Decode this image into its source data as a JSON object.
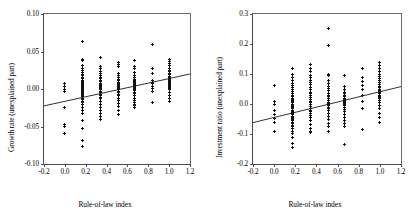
{
  "figure": {
    "panel_count": 2,
    "marker_style": "plus-marker",
    "line_color": "#1a1a1a",
    "axis_color": "#4a4a4a"
  },
  "chart_data": [
    {
      "type": "scatter",
      "panel": "left",
      "title": "",
      "xlabel": "Rule-of-law index",
      "ylabel": "Growth rate (unexplained part)",
      "xlim": [
        -0.2,
        1.2
      ],
      "ylim": [
        -0.1,
        0.1
      ],
      "xticks": [
        -0.2,
        0.0,
        0.2,
        0.4,
        0.6,
        0.8,
        1.0,
        1.2
      ],
      "xticklabels": [
        "-0.2",
        "0.0",
        "0.2",
        "0.4",
        "0.6",
        "0.8",
        "1.0",
        "1.2"
      ],
      "yticks": [
        -0.1,
        -0.05,
        0.0,
        0.05,
        0.1
      ],
      "yticklabels": [
        "-0.10",
        "-0.05",
        "0.00",
        "0.05",
        "0.10"
      ],
      "grid": false,
      "legend": "none",
      "fit_line": {
        "x": [
          -0.2,
          1.2
        ],
        "y": [
          -0.0225,
          0.02
        ]
      },
      "x": [
        0.0,
        0.0,
        0.0,
        0.0,
        0.0,
        0.0,
        0.0,
        0.0,
        0.17,
        0.17,
        0.17,
        0.17,
        0.17,
        0.17,
        0.17,
        0.17,
        0.17,
        0.17,
        0.17,
        0.17,
        0.17,
        0.17,
        0.17,
        0.17,
        0.17,
        0.17,
        0.17,
        0.17,
        0.17,
        0.17,
        0.17,
        0.17,
        0.17,
        0.17,
        0.17,
        0.17,
        0.17,
        0.17,
        0.17,
        0.17,
        0.17,
        0.17,
        0.17,
        0.17,
        0.17,
        0.17,
        0.17,
        0.17,
        0.17,
        0.17,
        0.17,
        0.17,
        0.17,
        0.17,
        0.34,
        0.34,
        0.34,
        0.34,
        0.34,
        0.34,
        0.34,
        0.34,
        0.34,
        0.34,
        0.34,
        0.34,
        0.34,
        0.34,
        0.34,
        0.34,
        0.34,
        0.34,
        0.34,
        0.34,
        0.34,
        0.34,
        0.34,
        0.34,
        0.34,
        0.34,
        0.34,
        0.34,
        0.34,
        0.34,
        0.34,
        0.34,
        0.34,
        0.51,
        0.51,
        0.51,
        0.51,
        0.51,
        0.51,
        0.51,
        0.51,
        0.51,
        0.51,
        0.51,
        0.51,
        0.51,
        0.51,
        0.51,
        0.51,
        0.51,
        0.51,
        0.51,
        0.51,
        0.51,
        0.51,
        0.51,
        0.51,
        0.51,
        0.51,
        0.51,
        0.51,
        0.67,
        0.67,
        0.67,
        0.67,
        0.67,
        0.67,
        0.67,
        0.67,
        0.67,
        0.67,
        0.67,
        0.67,
        0.67,
        0.67,
        0.67,
        0.67,
        0.67,
        0.67,
        0.67,
        0.67,
        0.67,
        0.67,
        0.67,
        0.67,
        0.67,
        0.67,
        0.67,
        0.67,
        0.67,
        0.67,
        0.67,
        0.84,
        0.84,
        0.84,
        0.84,
        0.84,
        0.84,
        0.84,
        0.84,
        0.84,
        0.84,
        1.0,
        1.0,
        1.0,
        1.0,
        1.0,
        1.0,
        1.0,
        1.0,
        1.0,
        1.0,
        1.0,
        1.0,
        1.0,
        1.0,
        1.0,
        1.0,
        1.0,
        1.0,
        1.0,
        1.0,
        1.0,
        1.0,
        1.0,
        1.0,
        1.0,
        1.0,
        1.0,
        1.0,
        1.0,
        1.0
      ],
      "y": [
        0.007,
        0.004,
        -0.001,
        -0.003,
        -0.025,
        -0.047,
        -0.05,
        -0.059,
        0.063,
        0.04,
        0.038,
        0.031,
        0.028,
        0.025,
        0.022,
        0.02,
        0.018,
        0.016,
        0.014,
        0.012,
        0.011,
        0.01,
        0.009,
        0.008,
        0.007,
        0.006,
        0.005,
        0.004,
        0.003,
        0.002,
        0.001,
        0.0,
        -0.001,
        -0.002,
        -0.003,
        -0.004,
        -0.005,
        -0.006,
        -0.007,
        -0.008,
        -0.009,
        -0.01,
        -0.012,
        -0.014,
        -0.016,
        -0.018,
        -0.021,
        -0.024,
        -0.028,
        -0.033,
        -0.042,
        -0.052,
        -0.068,
        -0.076,
        0.042,
        0.03,
        0.027,
        0.024,
        0.021,
        0.018,
        0.016,
        0.014,
        0.012,
        0.01,
        0.008,
        0.007,
        0.006,
        0.005,
        0.004,
        0.003,
        0.002,
        0.001,
        0.0,
        -0.001,
        -0.003,
        -0.005,
        -0.007,
        -0.009,
        -0.011,
        -0.013,
        -0.016,
        -0.02,
        -0.024,
        -0.028,
        -0.032,
        -0.036,
        -0.04,
        0.036,
        0.033,
        0.03,
        0.021,
        0.018,
        0.015,
        0.013,
        0.011,
        0.009,
        0.007,
        0.006,
        0.005,
        0.004,
        0.003,
        0.002,
        0.001,
        0.0,
        -0.001,
        -0.003,
        -0.005,
        -0.007,
        -0.009,
        -0.012,
        -0.015,
        -0.019,
        -0.023,
        -0.028,
        -0.034,
        0.038,
        0.03,
        0.027,
        0.022,
        0.018,
        0.015,
        0.013,
        0.011,
        0.01,
        0.009,
        0.008,
        0.007,
        0.006,
        0.005,
        0.004,
        0.003,
        0.002,
        0.001,
        0.0,
        -0.001,
        -0.002,
        -0.004,
        -0.006,
        -0.009,
        -0.012,
        -0.015,
        -0.018,
        -0.02,
        -0.021,
        -0.022,
        -0.024,
        0.059,
        0.028,
        0.021,
        0.012,
        0.009,
        0.007,
        0.004,
        0.001,
        -0.003,
        -0.018,
        0.04,
        0.037,
        0.034,
        0.031,
        0.028,
        0.025,
        0.023,
        0.021,
        0.019,
        0.017,
        0.015,
        0.014,
        0.013,
        0.012,
        0.011,
        0.01,
        0.009,
        0.008,
        0.007,
        0.006,
        0.005,
        0.004,
        0.003,
        0.002,
        0.001,
        0.0,
        -0.004,
        -0.008,
        -0.012,
        -0.016
      ]
    },
    {
      "type": "scatter",
      "panel": "right",
      "title": "",
      "xlabel": "Rule-of-law index",
      "ylabel": "Investment ratio (unexplained part)",
      "xlim": [
        -0.2,
        1.2
      ],
      "ylim": [
        -0.2,
        0.3
      ],
      "xticks": [
        -0.2,
        0.0,
        0.2,
        0.4,
        0.6,
        0.8,
        1.0,
        1.2
      ],
      "xticklabels": [
        "-0.2",
        "0.0",
        "0.2",
        "0.4",
        "0.6",
        "0.8",
        "1.0",
        "1.2"
      ],
      "yticks": [
        -0.2,
        -0.1,
        0.0,
        0.1,
        0.2,
        0.3
      ],
      "yticklabels": [
        "-0.2",
        "-0.1",
        "0.0",
        "0.1",
        "0.2",
        "0.3"
      ],
      "grid": false,
      "legend": "none",
      "fit_line": {
        "x": [
          -0.2,
          1.2
        ],
        "y": [
          -0.062,
          0.058
        ]
      },
      "x": [
        0.0,
        0.0,
        0.0,
        0.0,
        0.0,
        0.0,
        0.0,
        0.0,
        0.17,
        0.17,
        0.17,
        0.17,
        0.17,
        0.17,
        0.17,
        0.17,
        0.17,
        0.17,
        0.17,
        0.17,
        0.17,
        0.17,
        0.17,
        0.17,
        0.17,
        0.17,
        0.17,
        0.17,
        0.17,
        0.17,
        0.17,
        0.17,
        0.17,
        0.17,
        0.17,
        0.17,
        0.17,
        0.17,
        0.17,
        0.17,
        0.17,
        0.17,
        0.17,
        0.17,
        0.17,
        0.17,
        0.17,
        0.17,
        0.17,
        0.17,
        0.34,
        0.34,
        0.34,
        0.34,
        0.34,
        0.34,
        0.34,
        0.34,
        0.34,
        0.34,
        0.34,
        0.34,
        0.34,
        0.34,
        0.34,
        0.34,
        0.34,
        0.34,
        0.34,
        0.34,
        0.34,
        0.34,
        0.34,
        0.34,
        0.34,
        0.34,
        0.34,
        0.34,
        0.34,
        0.34,
        0.51,
        0.51,
        0.51,
        0.51,
        0.51,
        0.51,
        0.51,
        0.51,
        0.51,
        0.51,
        0.51,
        0.51,
        0.51,
        0.51,
        0.51,
        0.51,
        0.51,
        0.51,
        0.51,
        0.51,
        0.51,
        0.51,
        0.51,
        0.51,
        0.51,
        0.51,
        0.51,
        0.67,
        0.67,
        0.67,
        0.67,
        0.67,
        0.67,
        0.67,
        0.67,
        0.67,
        0.67,
        0.67,
        0.67,
        0.67,
        0.67,
        0.67,
        0.67,
        0.67,
        0.67,
        0.67,
        0.67,
        0.67,
        0.67,
        0.67,
        0.67,
        0.67,
        0.67,
        0.67,
        0.67,
        0.84,
        0.84,
        0.84,
        0.84,
        0.84,
        0.84,
        0.84,
        0.84,
        0.84,
        1.0,
        1.0,
        1.0,
        1.0,
        1.0,
        1.0,
        1.0,
        1.0,
        1.0,
        1.0,
        1.0,
        1.0,
        1.0,
        1.0,
        1.0,
        1.0,
        1.0,
        1.0,
        1.0,
        1.0,
        1.0,
        1.0,
        1.0,
        1.0,
        1.0,
        1.0,
        1.0,
        1.0
      ],
      "y": [
        0.062,
        0.01,
        -0.003,
        -0.022,
        -0.035,
        -0.048,
        -0.062,
        -0.09,
        0.118,
        0.1,
        0.09,
        0.078,
        0.07,
        0.062,
        0.055,
        0.048,
        0.042,
        0.036,
        0.03,
        0.025,
        0.02,
        0.016,
        0.012,
        0.008,
        0.004,
        0.0,
        -0.004,
        -0.008,
        -0.012,
        -0.016,
        -0.02,
        -0.024,
        -0.028,
        -0.032,
        -0.036,
        -0.04,
        -0.044,
        -0.048,
        -0.052,
        -0.056,
        -0.06,
        -0.065,
        -0.07,
        -0.076,
        -0.082,
        -0.09,
        -0.098,
        -0.11,
        -0.13,
        -0.145,
        0.133,
        0.12,
        0.108,
        0.096,
        0.088,
        0.08,
        0.072,
        0.064,
        0.056,
        0.048,
        0.04,
        0.034,
        0.028,
        0.022,
        0.016,
        0.01,
        0.004,
        -0.002,
        -0.008,
        -0.014,
        -0.02,
        -0.026,
        -0.032,
        -0.038,
        -0.046,
        -0.056,
        -0.068,
        -0.08,
        -0.092,
        -0.096,
        0.253,
        0.196,
        0.1,
        0.094,
        0.08,
        0.07,
        0.06,
        0.052,
        0.044,
        0.036,
        0.03,
        0.024,
        0.018,
        0.012,
        0.006,
        0.002,
        -0.002,
        -0.006,
        -0.01,
        -0.016,
        -0.022,
        -0.03,
        -0.04,
        -0.052,
        -0.064,
        -0.076,
        -0.09,
        0.094,
        0.06,
        0.048,
        0.04,
        0.034,
        0.028,
        0.024,
        0.02,
        0.018,
        0.016,
        0.014,
        0.012,
        0.01,
        0.008,
        0.006,
        0.004,
        0.002,
        0.0,
        -0.004,
        -0.01,
        -0.018,
        -0.026,
        -0.034,
        -0.044,
        -0.056,
        -0.066,
        -0.076,
        -0.134,
        0.119,
        0.09,
        0.076,
        0.062,
        0.048,
        0.03,
        0.01,
        -0.016,
        -0.084,
        0.14,
        0.13,
        0.12,
        0.11,
        0.1,
        0.092,
        0.084,
        0.078,
        0.072,
        0.066,
        0.06,
        0.055,
        0.05,
        0.046,
        0.042,
        0.038,
        0.034,
        0.03,
        0.026,
        0.022,
        0.018,
        0.012,
        0.004,
        -0.004,
        -0.016,
        -0.03,
        -0.044,
        -0.06
      ]
    }
  ]
}
